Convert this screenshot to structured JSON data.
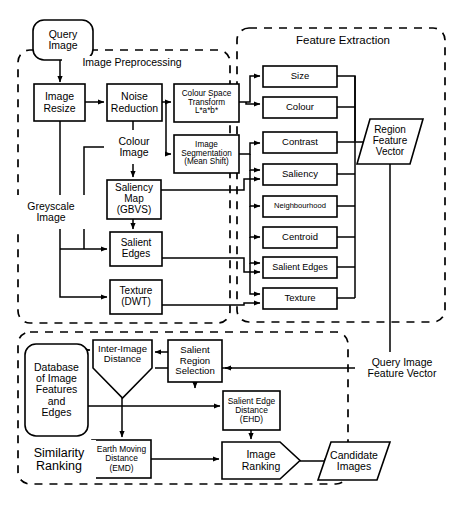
{
  "diagram": {
    "groups": [
      {
        "id": "image-preprocessing",
        "label": "Image Preprocessing",
        "x": 18,
        "y": 50,
        "w": 212,
        "h": 273,
        "label_x": 62,
        "label_y": 56,
        "label_w": 140,
        "label_h": 14,
        "font": 10.5
      },
      {
        "id": "feature-extraction",
        "label": "Feature Extraction",
        "x": 237,
        "y": 28,
        "w": 208,
        "h": 294,
        "label_x": 268,
        "label_y": 32,
        "label_w": 150,
        "label_h": 16,
        "font": 11.5
      },
      {
        "id": "similarity-ranking",
        "label": "Similarity Ranking",
        "x": 18,
        "y": 332,
        "w": 330,
        "h": 152,
        "label_x": 22,
        "label_y": 440,
        "label_w": 74,
        "label_h": 40,
        "font": 12.5
      }
    ],
    "nodes": [
      {
        "id": "query-image",
        "shape": "rounded",
        "label": "Query\nImage",
        "x": 33,
        "y": 20,
        "w": 60,
        "h": 40,
        "font": 10.5
      },
      {
        "id": "image-resize",
        "shape": "rect",
        "label": "Image\nResize",
        "x": 34,
        "y": 84,
        "w": 51,
        "h": 37,
        "font": 10.5
      },
      {
        "id": "noise-reduction",
        "shape": "rect",
        "label": "Noise\nReduction",
        "x": 107,
        "y": 84,
        "w": 55,
        "h": 37,
        "font": 10.5
      },
      {
        "id": "colour-space-transform",
        "shape": "rect",
        "label": "Colour Space\nTransform\nL*a*b*",
        "x": 174,
        "y": 84,
        "w": 65,
        "h": 38,
        "font": 8.2
      },
      {
        "id": "image-segmentation",
        "shape": "rect",
        "label": "Image\nSegmentation\n(Mean Shift)",
        "x": 174,
        "y": 135,
        "w": 65,
        "h": 38,
        "font": 8.2
      },
      {
        "id": "saliency-map",
        "shape": "rect",
        "label": "Saliency\nMap\n(GBVS)",
        "x": 107,
        "y": 180,
        "w": 54,
        "h": 39,
        "font": 10
      },
      {
        "id": "salient-edges-pre",
        "shape": "rect",
        "label": "Salient\nEdges",
        "x": 110,
        "y": 232,
        "w": 52,
        "h": 34,
        "font": 10
      },
      {
        "id": "texture-dwt",
        "shape": "rect",
        "label": "Texture\n(DWT)",
        "x": 110,
        "y": 280,
        "w": 52,
        "h": 34,
        "font": 10
      },
      {
        "id": "feature-size",
        "shape": "rect",
        "label": "Size",
        "x": 263,
        "y": 66,
        "w": 74,
        "h": 21,
        "font": 9.5
      },
      {
        "id": "feature-colour",
        "shape": "rect",
        "label": "Colour",
        "x": 263,
        "y": 97,
        "w": 74,
        "h": 21,
        "font": 9.5
      },
      {
        "id": "feature-contrast",
        "shape": "rect",
        "label": "Contrast",
        "x": 263,
        "y": 132,
        "w": 74,
        "h": 21,
        "font": 9.5
      },
      {
        "id": "feature-saliency",
        "shape": "rect",
        "label": "Saliency",
        "x": 263,
        "y": 164,
        "w": 74,
        "h": 21,
        "font": 9.5
      },
      {
        "id": "feature-neighbourhood",
        "shape": "rect",
        "label": "Neighbourhood",
        "x": 263,
        "y": 196,
        "w": 74,
        "h": 21,
        "font": 7.6
      },
      {
        "id": "feature-centroid",
        "shape": "rect",
        "label": "Centroid",
        "x": 263,
        "y": 227,
        "w": 74,
        "h": 21,
        "font": 9.5
      },
      {
        "id": "feature-salient-edges",
        "shape": "rect",
        "label": "Salient Edges",
        "x": 263,
        "y": 257,
        "w": 74,
        "h": 21,
        "font": 9
      },
      {
        "id": "feature-texture",
        "shape": "rect",
        "label": "Texture",
        "x": 263,
        "y": 288,
        "w": 74,
        "h": 21,
        "font": 9.5
      },
      {
        "id": "region-feature-vector",
        "shape": "parallelogram",
        "label": "Region\nFeature\nVector",
        "x": 357,
        "y": 119,
        "w": 66,
        "h": 45,
        "font": 10
      },
      {
        "id": "database-image-features",
        "shape": "rounded",
        "label": "Database\nof Image\nFeatures\nand\nEdges",
        "x": 25,
        "y": 344,
        "w": 63,
        "h": 92,
        "font": 10.5
      },
      {
        "id": "inter-image-distance",
        "shape": "trapezoid-down",
        "label": "Inter-Image\nDistance",
        "x": 93,
        "y": 340,
        "w": 59,
        "h": 58,
        "font": 9.6,
        "body_h": 28
      },
      {
        "id": "salient-region-selection",
        "shape": "rect",
        "label": "Salient\nRegion\nSelection",
        "x": 168,
        "y": 340,
        "w": 54,
        "h": 42,
        "font": 9.6
      },
      {
        "id": "salient-edge-distance",
        "shape": "rect",
        "label": "Salient Edge\nDistance\n(EHD)",
        "x": 223,
        "y": 391,
        "w": 57,
        "h": 39,
        "font": 8.4
      },
      {
        "id": "earth-moving-distance",
        "shape": "rect",
        "label": "Earth Moving\nDistance\n(EMD)",
        "x": 92,
        "y": 440,
        "w": 59,
        "h": 38,
        "font": 8.4
      },
      {
        "id": "image-ranking",
        "shape": "pentagon",
        "label": "Image\nRanking",
        "x": 222,
        "y": 442,
        "w": 78,
        "h": 37,
        "font": 10.5
      },
      {
        "id": "candidate-images",
        "shape": "parallelogram",
        "label": "Candidate\nImages",
        "x": 318,
        "y": 442,
        "w": 72,
        "h": 38,
        "font": 10.5
      }
    ],
    "free_labels": [
      {
        "id": "greyscale-image-label",
        "label": "Greyscale\nImage",
        "x": 16,
        "y": 195,
        "w": 70,
        "h": 34,
        "font": 10.5
      },
      {
        "id": "colour-image-label",
        "label": "Colour\nImage",
        "x": 104,
        "y": 130,
        "w": 60,
        "h": 34,
        "font": 10.5
      },
      {
        "id": "query-image-feature-vector-label",
        "label": "Query Image\nFeature Vector",
        "x": 355,
        "y": 352,
        "w": 94,
        "h": 32,
        "font": 10.5
      }
    ],
    "edges": [
      {
        "id": "e-query-to-resize",
        "path": "M 60,60 L 60,82",
        "arrow": true
      },
      {
        "id": "e-resize-to-noise",
        "path": "M 85,102 L 104,102",
        "arrow": true
      },
      {
        "id": "e-noise-to-cst",
        "path": "M 162,102 L 171,102",
        "arrow": true
      },
      {
        "id": "e-noise-down",
        "path": "M 166,102 L 166,154 L 171,154",
        "arrow": true
      },
      {
        "id": "e-resize-grey-down",
        "path": "M 60,121 L 60,195",
        "arrow": false
      },
      {
        "id": "e-grey-down-long",
        "path": "M 60,229 L 60,297 L 107,297",
        "arrow": true
      },
      {
        "id": "e-grey-to-salient",
        "path": "M 60,249 L 92,249 L 107,249",
        "arrow": true
      },
      {
        "id": "e-colour-branch",
        "path": "M 133,121 L 133,130",
        "arrow": false
      },
      {
        "id": "e-colour-to-saliency",
        "path": "M 133,164 L 133,177",
        "arrow": true
      },
      {
        "id": "e-saliency-to-salient",
        "path": "M 133,219 L 133,229",
        "arrow": true
      },
      {
        "id": "e-colourimg-left",
        "path": "M 104,147 L 84,147 L 84,249",
        "arrow": false
      },
      {
        "id": "e-cst-to-size",
        "path": "M 239,102 L 250,102 L 250,76 L 260,76",
        "arrow": true
      },
      {
        "id": "e-cst-to-colour",
        "path": "M 246,102 L 246,104 L 260,104",
        "arrow": true
      },
      {
        "id": "e-seg-to-size-bus",
        "path": "M 239,154 L 250,154 L 250,143 L 260,143",
        "arrow": true
      },
      {
        "id": "e-bus-to-saliency-feat",
        "path": "M 250,154 L 250,170 L 260,170",
        "arrow": true
      },
      {
        "id": "e-bus-to-neighbourhood",
        "path": "M 250,170 L 250,206 L 260,206",
        "arrow": true
      },
      {
        "id": "e-bus-to-centroid",
        "path": "M 250,206 L 250,237 L 260,237",
        "arrow": true
      },
      {
        "id": "e-bus-to-salient-edge-feat",
        "path": "M 250,237 L 250,263 L 260,263",
        "arrow": true
      },
      {
        "id": "e-bus-to-texture-feat",
        "path": "M 250,263 L 250,294 L 260,294",
        "arrow": true
      },
      {
        "id": "e-saliency-map-to-feat",
        "path": "M 161,190 L 244,190 L 244,179 L 260,179",
        "arrow": true
      },
      {
        "id": "e-salient-edges-to-feat",
        "path": "M 162,258 L 244,258 L 244,272 L 260,272",
        "arrow": true
      },
      {
        "id": "e-texture-to-feat",
        "path": "M 162,305 L 244,305 L 244,303 L 260,303",
        "arrow": true
      },
      {
        "id": "e-size-bus",
        "path": "M 337,76 L 355,76 L 355,141",
        "arrow": false
      },
      {
        "id": "e-colour-bus",
        "path": "M 337,107 L 355,107",
        "arrow": false
      },
      {
        "id": "e-contrast-to-rfv",
        "path": "M 337,142 L 390,142",
        "arrow": true
      },
      {
        "id": "e-saliency-bus",
        "path": "M 337,174 L 355,174",
        "arrow": false
      },
      {
        "id": "e-neigh-bus",
        "path": "M 337,206 L 355,206",
        "arrow": false
      },
      {
        "id": "e-centroid-bus",
        "path": "M 337,237 L 355,237",
        "arrow": false
      },
      {
        "id": "e-sedge-bus",
        "path": "M 337,267 L 355,267",
        "arrow": false
      },
      {
        "id": "e-texture-bus",
        "path": "M 337,298 L 355,298",
        "arrow": false
      },
      {
        "id": "e-feat-bus-vertical",
        "path": "M 355,76 L 355,298",
        "arrow": false
      },
      {
        "id": "e-rfv-down",
        "path": "M 390,164 L 390,360 L 374,360",
        "arrow": false
      },
      {
        "id": "e-qfv-to-left",
        "path": "M 355,368 L 155,368",
        "arrow": false
      },
      {
        "id": "e-qfv-to-selection",
        "path": "M 232,368 L 225,368",
        "arrow": true
      },
      {
        "id": "e-db-to-inter",
        "path": "M 88,350 L 90,350",
        "arrow": true
      },
      {
        "id": "e-selection-to-inter",
        "path": "M 168,352 L 155,352",
        "arrow": true
      },
      {
        "id": "e-inter-down",
        "path": "M 122,398 L 122,437",
        "arrow": true
      },
      {
        "id": "e-db-to-edgedist",
        "path": "M 88,406 L 220,406",
        "arrow": true
      },
      {
        "id": "e-sel-down-to-edgedist",
        "path": "M 195,368 L 195,388",
        "arrow": true
      },
      {
        "id": "e-emd-to-ranking",
        "path": "M 151,459 L 219,459",
        "arrow": true
      },
      {
        "id": "e-edgedist-down",
        "path": "M 251,430 L 251,439",
        "arrow": true
      },
      {
        "id": "e-db-to-ranking",
        "path": "M 88,460 L 88,460",
        "arrow": false
      },
      {
        "id": "e-ranking-to-candidate",
        "path": "M 300,461 L 330,461",
        "arrow": true
      }
    ]
  }
}
